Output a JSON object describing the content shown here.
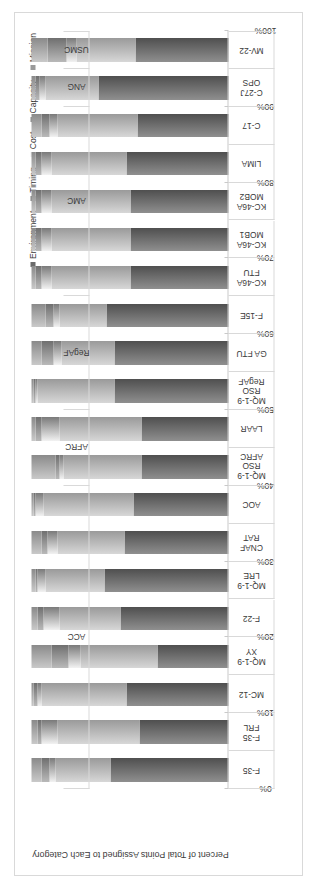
{
  "chart_data": {
    "type": "bar",
    "subtype": "100-percent-stacked-horizontal",
    "title": "",
    "xlabel": "",
    "ylabel": "Percent of Total Points Assigned to Each Category",
    "ylim": [
      0,
      100
    ],
    "tick_labels": [
      "0%",
      "10%",
      "20%",
      "30%",
      "40%",
      "50%",
      "60%",
      "70%",
      "80%",
      "90%",
      "100%"
    ],
    "grid": false,
    "legend_position": "top-right",
    "legend": [
      "Environment",
      "Timing",
      "Cost",
      "Capacity",
      "Mission"
    ],
    "categories": [
      "F-35",
      "F-35 FRL",
      "MC-12",
      "MQ-1-9 XY",
      "F-22",
      "MQ-1-9 LRE",
      "CNAF RAT",
      "AOC",
      "MQ-1-9 RSO AFRC",
      "LAAR",
      "MQ-1-9 RSO RegAF",
      "GA FTU",
      "F-15E",
      "KC-46A FTU",
      "KC-46A MOB1",
      "KC-46A MOB2",
      "LIMA",
      "C-17",
      "C-27J OPS",
      "MV-22"
    ],
    "category_lines": [
      [
        "F-35"
      ],
      [
        "F-35",
        "FRL"
      ],
      [
        "MC-12"
      ],
      [
        "MQ-1-9",
        "XY"
      ],
      [
        "F-22"
      ],
      [
        "MQ-1-9",
        "LRE"
      ],
      [
        "CNAF",
        "RAT"
      ],
      [
        "AOC"
      ],
      [
        "MQ-1-9",
        "RSO",
        "AFRC"
      ],
      [
        "LAAR"
      ],
      [
        "MQ-1-9",
        "RSO",
        "RegAF"
      ],
      [
        "GA FTU"
      ],
      [
        "F-15E"
      ],
      [
        "KC-46A",
        "FTU"
      ],
      [
        "KC-46A",
        "MOB1"
      ],
      [
        "KC-46A",
        "MOB2"
      ],
      [
        "LIMA"
      ],
      [
        "C-17"
      ],
      [
        "C-27J",
        "OPS"
      ],
      [
        "MV-22"
      ]
    ],
    "groups": [
      {
        "label": "ACC",
        "start": 0,
        "span": 8
      },
      {
        "label": "AFRC",
        "start": 8,
        "span": 2
      },
      {
        "label": "RegAF",
        "start": 10,
        "span": 3
      },
      {
        "label": "AMC",
        "start": 13,
        "span": 5
      },
      {
        "label": "ANG",
        "start": 18,
        "span": 1
      },
      {
        "label": "USMC",
        "start": 19,
        "span": 1
      }
    ],
    "series": [
      {
        "name": "Mission",
        "values": [
          60,
          45,
          52,
          36,
          55,
          63,
          53,
          48,
          44,
          44,
          58,
          58,
          62,
          50,
          50,
          50,
          52,
          46,
          66,
          47
        ]
      },
      {
        "name": "Capacity",
        "values": [
          28,
          42,
          43,
          39,
          31,
          30,
          34,
          46,
          40,
          42,
          39,
          27,
          24,
          40,
          40,
          40,
          38,
          41,
          27,
          30
        ]
      },
      {
        "name": "Cost",
        "values": [
          3,
          8,
          2,
          6,
          8,
          4,
          5,
          4,
          2,
          9,
          1,
          4,
          3,
          5,
          5,
          5,
          5,
          4,
          3,
          5
        ]
      },
      {
        "name": "Timing",
        "values": [
          4,
          2,
          2,
          9,
          3,
          1,
          3,
          1,
          2,
          3,
          1,
          6,
          4,
          3,
          3,
          3,
          3,
          4,
          2,
          10
        ]
      },
      {
        "name": "Environment",
        "values": [
          5,
          3,
          1,
          10,
          3,
          2,
          5,
          1,
          12,
          2,
          1,
          5,
          7,
          2,
          2,
          2,
          2,
          5,
          2,
          8
        ]
      }
    ],
    "series_colors": [
      "#6b6b6b",
      "#7f7f7f",
      "#ededed",
      "#8a8a8a",
      "#9a9a9a"
    ]
  }
}
